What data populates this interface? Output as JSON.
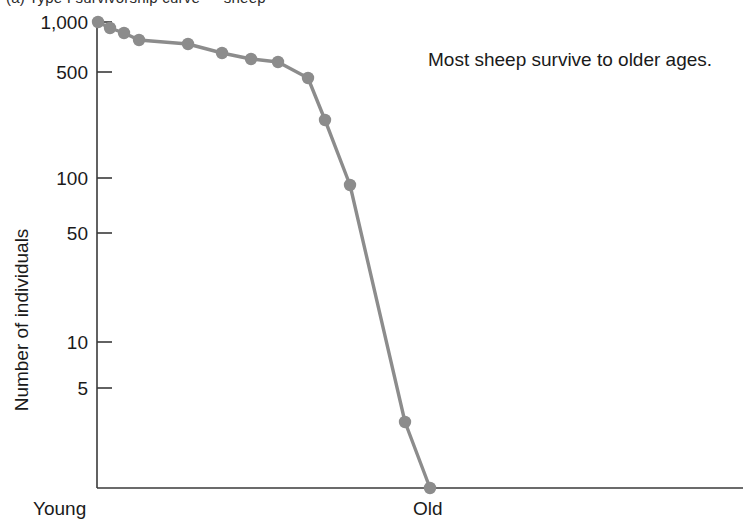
{
  "figure": {
    "cropped_top_text": "(a)   Type I  survivorship curve — sheep",
    "annotation": "Most sheep survive to older ages."
  },
  "chart_data": {
    "type": "line",
    "title": "",
    "subtitle": "",
    "xlabel": "",
    "ylabel": "Number of individuals",
    "scale": "log-y",
    "grid": false,
    "legend": null,
    "annotations": [
      {
        "text": "Most sheep survive to older ages.",
        "x_px": 428,
        "y_px": 66
      }
    ],
    "y_ticks": [
      1000,
      500,
      100,
      50,
      10,
      5
    ],
    "y_tick_labels": [
      "1,000",
      "500",
      "100",
      "50",
      "10",
      "5"
    ],
    "ylim": [
      1,
      1000
    ],
    "x_tick_labels": [
      "Young",
      "Old"
    ],
    "x_tick_positions": [
      0,
      3.9
    ],
    "xlim": [
      0,
      6.7
    ],
    "series": [
      {
        "name": "Sheep survivorship",
        "color": "#8c8c8c",
        "marker": "circle",
        "x": [
          0.0,
          0.25,
          0.55,
          0.87,
          1.9,
          2.63,
          3.24,
          3.82,
          4.45,
          4.8,
          5.15,
          5.68,
          6.55
        ],
        "values": [
          1000,
          910,
          840,
          760,
          730,
          700,
          660,
          620,
          510,
          480,
          300,
          95,
          3
        ],
        "x_px": [
          98,
          110,
          124,
          139,
          188,
          222,
          251,
          278,
          308,
          325,
          350,
          405,
          430
        ],
        "y_px": [
          22,
          28,
          33,
          40,
          44,
          53,
          59,
          62,
          78,
          120,
          185,
          422,
          488
        ]
      }
    ]
  },
  "colors": {
    "data_gray": "#8c8c8c",
    "axis_black": "#3a3a3a",
    "text": "#1a1a1a",
    "background": "#ffffff"
  }
}
